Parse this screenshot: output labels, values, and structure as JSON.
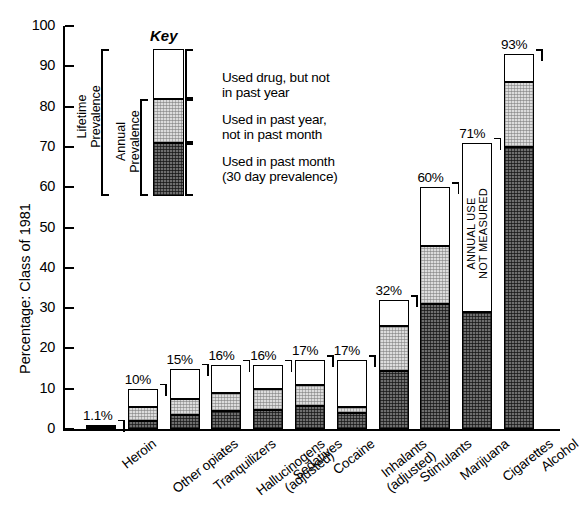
{
  "chart_data": {
    "type": "bar",
    "title": "",
    "xlabel": "",
    "ylabel": "Percentage: Class of 1981",
    "ylim": [
      0,
      100
    ],
    "yticks": [
      0,
      10,
      20,
      30,
      40,
      50,
      60,
      70,
      80,
      90,
      100
    ],
    "grid": false,
    "legend_position": "inside-top-left",
    "stacked": true,
    "categories": [
      "Heroin",
      "Other opiates",
      "Tranquilizers",
      "Hallucinogens\n(adjusted)",
      "Sedatives",
      "Cocaine",
      "Inhalants\n(adjusted)",
      "Stimulants",
      "Marijuana",
      "Cigarettes",
      "Alcohol"
    ],
    "series": [
      {
        "name": "Used in past month (30 day prevalence)",
        "values": [
          0.5,
          2.1,
          3.5,
          4.5,
          4.8,
          5.8,
          4.0,
          14.5,
          31.0,
          29.0,
          70.0
        ]
      },
      {
        "name": "Used in past year, not in past month",
        "values": [
          0.6,
          3.4,
          4.0,
          4.5,
          5.2,
          5.2,
          1.5,
          11.0,
          14.5,
          0,
          16.0
        ]
      },
      {
        "name": "Used drug, but not in past year",
        "values": [
          0,
          4.5,
          7.5,
          7.0,
          6.0,
          6.0,
          11.5,
          6.5,
          14.5,
          42.0,
          7.0
        ]
      }
    ],
    "totals": [
      1.1,
      10,
      15,
      16,
      16,
      17,
      17,
      32,
      60,
      71,
      93
    ],
    "total_labels": [
      "1.1%",
      "10%",
      "15%",
      "16%",
      "16%",
      "17%",
      "17%",
      "32%",
      "60%",
      "71%",
      "93%"
    ],
    "annotations": [
      {
        "category": "Cigarettes",
        "text": "ANNUAL USE NOT MEASURED",
        "text_line1": "ANNUAL USE",
        "text_line2": "NOT MEASURED"
      }
    ]
  },
  "key": {
    "title": "Key",
    "entries": [
      {
        "swatch": "white",
        "line1": "Used drug, but not",
        "line2": "in past year"
      },
      {
        "swatch": "light",
        "line1": "Used in past year,",
        "line2": "not in past month"
      },
      {
        "swatch": "dark",
        "line1": "Used in past month",
        "line2": "(30 day prevalence)"
      }
    ],
    "bracket_labels": [
      {
        "line1": "Lifetime",
        "line2": "Prevalence"
      },
      {
        "line1": "Annual",
        "line2": "Prevalence"
      }
    ]
  },
  "colors": {
    "axis": "#000000",
    "swatch_white": "#ffffff",
    "swatch_light": "#dcdcdc",
    "swatch_dark": "#6e6e6e",
    "text": "#000000"
  }
}
